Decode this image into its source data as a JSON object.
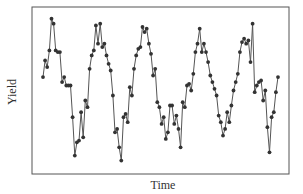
{
  "chart_data": {
    "type": "line",
    "title": "",
    "xlabel": "Time",
    "ylabel": "Yield",
    "grid": false,
    "legend": null,
    "x_ticks": [],
    "y_ticks": [],
    "ylim": [
      0,
      100
    ],
    "value_note": "No axis tick labels are shown; y values are estimated on a relative 0-100 scale (0 = bottom of frame, 100 = top). Later points are approximate.",
    "marker": "circle",
    "line_color": "#555555",
    "marker_color": "#333333",
    "series": [
      {
        "name": "Yield",
        "values": [
          58,
          68,
          64,
          74,
          93,
          90,
          74,
          73,
          73,
          55,
          58,
          53,
          53,
          53,
          34,
          11,
          19,
          20,
          37,
          22,
          44,
          40,
          63,
          71,
          74,
          89,
          78,
          90,
          76,
          78,
          71,
          66,
          62,
          47,
          25,
          27,
          16,
          8,
          34,
          36,
          31,
          52,
          47,
          63,
          71,
          75,
          76,
          88,
          85,
          87,
          78,
          72,
          59,
          63,
          43,
          40,
          30,
          34,
          21,
          25,
          41,
          41,
          30,
          35,
          27,
          16,
          43,
          40,
          53,
          54,
          50,
          60,
          73,
          78,
          87,
          73,
          78,
          73,
          67,
          59,
          55,
          51,
          47,
          35,
          31,
          23,
          27,
          37,
          31,
          41,
          50,
          55,
          60,
          73,
          79,
          81,
          78,
          80,
          67,
          90,
          49,
          53,
          55,
          56,
          44,
          50,
          28,
          13,
          34,
          37,
          49,
          58
        ]
      }
    ]
  },
  "axes": {
    "x_label": "Time",
    "y_label": "Yield"
  }
}
